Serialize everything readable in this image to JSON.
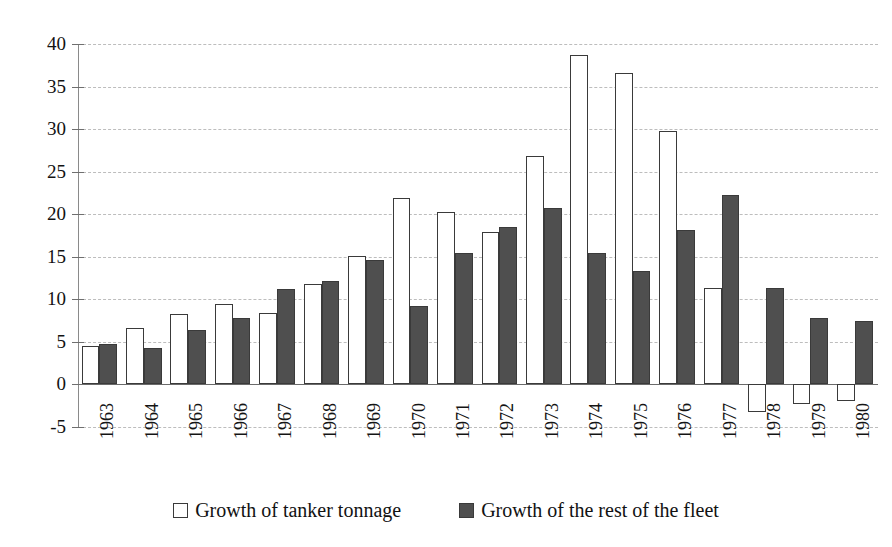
{
  "chart_data": {
    "type": "bar",
    "title": "",
    "subtitle": "",
    "xlabel": "",
    "ylabel": "",
    "ylim": [
      -5,
      40
    ],
    "ytick_step": 5,
    "yticks": [
      40,
      35,
      30,
      25,
      20,
      15,
      10,
      5,
      0,
      -5
    ],
    "ytick_labels": [
      "40",
      "35",
      "30",
      "25",
      "20",
      "15",
      "10",
      "5",
      "0",
      "-5"
    ],
    "grid": true,
    "grid_style": "dashed-horizontal",
    "legend_position": "bottom-center",
    "categories": [
      "1963",
      "1964",
      "1965",
      "1966",
      "1967",
      "1968",
      "1969",
      "1970",
      "1971",
      "1972",
      "1973",
      "1974",
      "1975",
      "1976",
      "1977",
      "1978",
      "1979",
      "1980"
    ],
    "series": [
      {
        "name": "Growth of tanker tonnage",
        "style": "open",
        "color": "#ffffff",
        "edge_color": "#3a3a3a",
        "values": [
          4.5,
          6.6,
          8.3,
          9.4,
          8.4,
          11.8,
          15.1,
          21.9,
          20.3,
          17.9,
          26.8,
          38.7,
          36.6,
          29.8,
          11.3,
          -3.2,
          -2.3,
          -2.0
        ]
      },
      {
        "name": "Growth of the rest of the fleet",
        "style": "filled",
        "color": "#4f4f4f",
        "edge_color": "#3a3a3a",
        "values": [
          4.8,
          4.3,
          6.4,
          7.8,
          11.2,
          12.1,
          14.6,
          9.2,
          15.4,
          18.5,
          20.7,
          15.4,
          13.3,
          18.1,
          22.2,
          11.3,
          7.8,
          7.5
        ]
      }
    ]
  },
  "legend": {
    "entries": [
      {
        "label": "Growth of tanker tonnage",
        "swatch": "open-square-icon"
      },
      {
        "label": "Growth of the rest of the fleet",
        "swatch": "filled-square-icon"
      }
    ]
  }
}
